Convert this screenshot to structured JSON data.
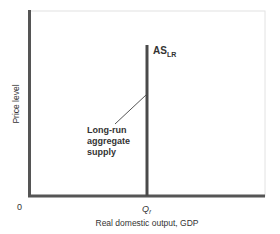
{
  "diagram": {
    "title": "Long-run aggregate supply",
    "y_axis_label": "Price level",
    "x_axis_label": "Real domestic output, GDP",
    "origin_label": "0",
    "x_marker": {
      "base": "Q",
      "sub": "f"
    },
    "curve_label": {
      "base": "AS",
      "sub": "LR"
    },
    "callout": [
      "Long-run",
      "aggregate",
      "supply"
    ],
    "colors": {
      "axis": "#555555",
      "curve": "#4a4a4a",
      "frame": "#dddddd",
      "text": "#333333"
    }
  }
}
